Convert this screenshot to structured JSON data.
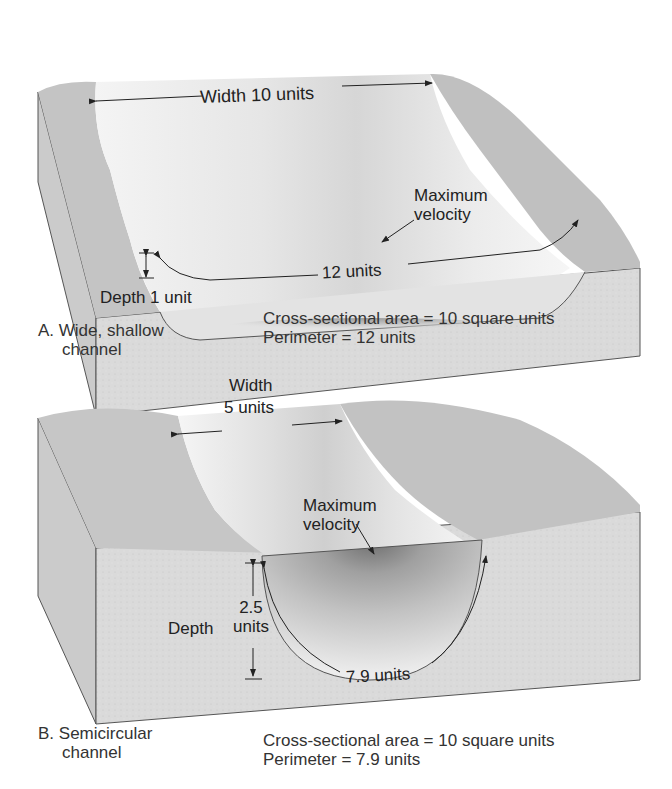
{
  "panels": [
    {
      "id": "A",
      "letter": "A.",
      "caption_line1": "Wide, shallow",
      "caption_line2": "channel",
      "width_label": "Width 10 units",
      "depth_label": "Depth 1 unit",
      "perimeter_arc_label": "12 units",
      "max_velocity_line1": "Maximum",
      "max_velocity_line2": "velocity",
      "area_text": "Cross-sectional area = 10 square units",
      "perimeter_text": "Perimeter = 12 units"
    },
    {
      "id": "B",
      "letter": "B.",
      "caption_line1": "Semicircular",
      "caption_line2": "channel",
      "width_label_line1": "Width",
      "width_label_line2": "5 units",
      "depth_label": "Depth",
      "depth_value_line1": "2.5",
      "depth_value_line2": "units",
      "perimeter_arc_label": "7.9 units",
      "max_velocity_line1": "Maximum",
      "max_velocity_line2": "velocity",
      "area_text": "Cross-sectional area = 10 square units",
      "perimeter_text": "Perimeter = 7.9 units"
    }
  ],
  "colors": {
    "block_face": "#dcdcdc",
    "block_side": "#cfcfcf",
    "land": "#c9c9c9",
    "water_light": "#efefef",
    "water_dark": "#8c8c8c",
    "ink": "#222222"
  }
}
